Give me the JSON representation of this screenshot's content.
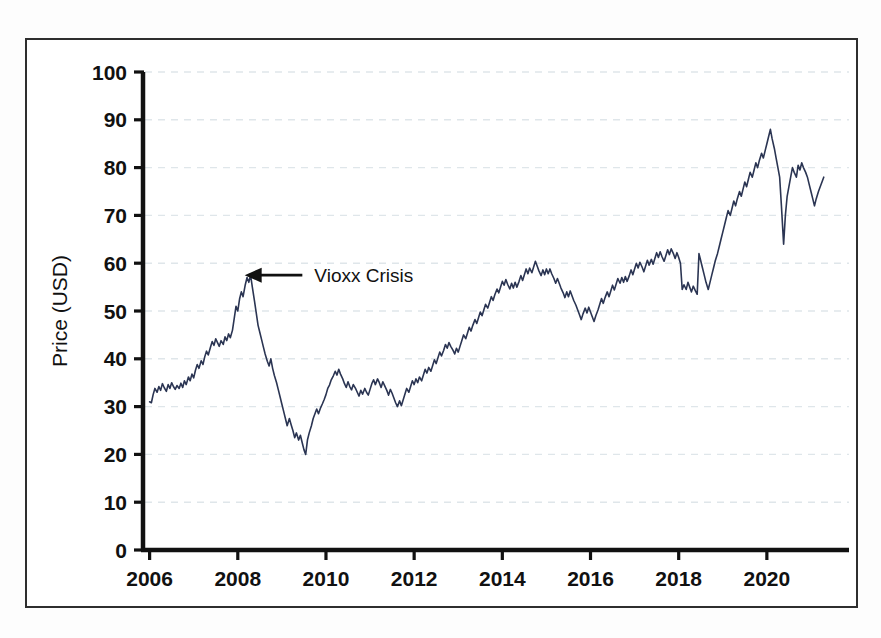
{
  "figure": {
    "background_color": "#ffffff",
    "frame_color": "#2e2e2e",
    "series_color": "#2b3553",
    "grid_color": "#dfe6ea",
    "axis_color": "#111111",
    "annotation_color": "#111111"
  },
  "chart_data": {
    "type": "line",
    "title": "",
    "subtitle": "",
    "xlabel": "",
    "ylabel": "Price (USD)",
    "xlim": [
      2005.85,
      2021.5
    ],
    "ylim": [
      0,
      100
    ],
    "grid": true,
    "grid_axis": "y",
    "grid_style": "dashed",
    "legend": null,
    "legend_position": "none",
    "y_ticks": [
      0,
      10,
      20,
      30,
      40,
      50,
      60,
      70,
      80,
      90,
      100
    ],
    "y_tick_labels": [
      "0",
      "10",
      "20",
      "30",
      "40",
      "50",
      "60",
      "70",
      "80",
      "90",
      "100"
    ],
    "x_ticks": [
      2006,
      2008,
      2010,
      2012,
      2014,
      2016,
      2018,
      2020
    ],
    "x_tick_labels": [
      "2006",
      "2008",
      "2010",
      "2012",
      "2014",
      "2016",
      "2018",
      "2020"
    ],
    "x_minor_step": 2,
    "annotations": [
      {
        "label": "Vioxx Crisis",
        "arrow": true,
        "arrow_direction": "left",
        "point_x": 2008.02,
        "point_y": 57.5,
        "text_x": 2009.6,
        "text_y": 57.5
      }
    ],
    "series": [
      {
        "name": "Price (USD)",
        "color": "#2b3553",
        "line_width": 1.6,
        "x": [
          2006.0,
          2006.04,
          2006.08,
          2006.12,
          2006.17,
          2006.21,
          2006.25,
          2006.29,
          2006.33,
          2006.38,
          2006.42,
          2006.46,
          2006.5,
          2006.54,
          2006.58,
          2006.62,
          2006.67,
          2006.71,
          2006.75,
          2006.79,
          2006.83,
          2006.88,
          2006.92,
          2006.96,
          2007.0,
          2007.04,
          2007.08,
          2007.12,
          2007.17,
          2007.21,
          2007.25,
          2007.29,
          2007.33,
          2007.38,
          2007.42,
          2007.46,
          2007.5,
          2007.54,
          2007.58,
          2007.62,
          2007.67,
          2007.71,
          2007.75,
          2007.79,
          2007.83,
          2007.88,
          2007.92,
          2007.96,
          2008.0,
          2008.04,
          2008.08,
          2008.12,
          2008.17,
          2008.21,
          2008.25,
          2008.29,
          2008.33,
          2008.38,
          2008.42,
          2008.46,
          2008.5,
          2008.54,
          2008.58,
          2008.62,
          2008.67,
          2008.71,
          2008.75,
          2008.79,
          2008.83,
          2008.88,
          2008.92,
          2008.96,
          2009.0,
          2009.04,
          2009.08,
          2009.12,
          2009.17,
          2009.21,
          2009.25,
          2009.29,
          2009.33,
          2009.38,
          2009.42,
          2009.46,
          2009.5,
          2009.54,
          2009.58,
          2009.62,
          2009.67,
          2009.71,
          2009.75,
          2009.79,
          2009.83,
          2009.88,
          2009.92,
          2009.96,
          2010.0,
          2010.04,
          2010.08,
          2010.12,
          2010.17,
          2010.21,
          2010.25,
          2010.29,
          2010.33,
          2010.38,
          2010.42,
          2010.46,
          2010.5,
          2010.54,
          2010.58,
          2010.62,
          2010.67,
          2010.71,
          2010.75,
          2010.79,
          2010.83,
          2010.88,
          2010.92,
          2010.96,
          2011.0,
          2011.04,
          2011.08,
          2011.12,
          2011.17,
          2011.21,
          2011.25,
          2011.29,
          2011.33,
          2011.38,
          2011.42,
          2011.46,
          2011.5,
          2011.54,
          2011.58,
          2011.62,
          2011.67,
          2011.71,
          2011.75,
          2011.79,
          2011.83,
          2011.88,
          2011.92,
          2011.96,
          2012.0,
          2012.04,
          2012.08,
          2012.12,
          2012.17,
          2012.21,
          2012.25,
          2012.29,
          2012.33,
          2012.38,
          2012.42,
          2012.46,
          2012.5,
          2012.54,
          2012.58,
          2012.62,
          2012.67,
          2012.71,
          2012.75,
          2012.79,
          2012.83,
          2012.88,
          2012.92,
          2012.96,
          2013.0,
          2013.04,
          2013.08,
          2013.12,
          2013.17,
          2013.21,
          2013.25,
          2013.29,
          2013.33,
          2013.38,
          2013.42,
          2013.46,
          2013.5,
          2013.54,
          2013.58,
          2013.62,
          2013.67,
          2013.71,
          2013.75,
          2013.79,
          2013.83,
          2013.88,
          2013.92,
          2013.96,
          2014.0,
          2014.04,
          2014.08,
          2014.12,
          2014.17,
          2014.21,
          2014.25,
          2014.29,
          2014.33,
          2014.38,
          2014.42,
          2014.46,
          2014.5,
          2014.54,
          2014.58,
          2014.62,
          2014.67,
          2014.71,
          2014.75,
          2014.79,
          2014.83,
          2014.88,
          2014.92,
          2014.96,
          2015.0,
          2015.04,
          2015.08,
          2015.12,
          2015.17,
          2015.21,
          2015.25,
          2015.29,
          2015.33,
          2015.38,
          2015.42,
          2015.46,
          2015.5,
          2015.54,
          2015.58,
          2015.62,
          2015.67,
          2015.71,
          2015.75,
          2015.79,
          2015.83,
          2015.88,
          2015.92,
          2015.96,
          2016.0,
          2016.04,
          2016.08,
          2016.12,
          2016.17,
          2016.21,
          2016.25,
          2016.29,
          2016.33,
          2016.38,
          2016.42,
          2016.46,
          2016.5,
          2016.54,
          2016.58,
          2016.62,
          2016.67,
          2016.71,
          2016.75,
          2016.79,
          2016.83,
          2016.88,
          2016.92,
          2016.96,
          2017.0,
          2017.04,
          2017.08,
          2017.12,
          2017.17,
          2017.21,
          2017.25,
          2017.29,
          2017.33,
          2017.38,
          2017.42,
          2017.46,
          2017.5,
          2017.54,
          2017.58,
          2017.62,
          2017.67,
          2017.71,
          2017.75,
          2017.79,
          2017.83,
          2017.88,
          2017.92,
          2017.96,
          2018.0,
          2018.04,
          2018.08,
          2018.12,
          2018.17,
          2018.21,
          2018.25,
          2018.29,
          2018.33,
          2018.38,
          2018.42,
          2018.46,
          2018.5,
          2018.54,
          2018.58,
          2018.62,
          2018.67,
          2018.71,
          2018.75,
          2018.79,
          2018.83,
          2018.88,
          2018.92,
          2018.96,
          2019.0,
          2019.04,
          2019.08,
          2019.12,
          2019.17,
          2019.21,
          2019.25,
          2019.29,
          2019.33,
          2019.38,
          2019.42,
          2019.46,
          2019.5,
          2019.54,
          2019.58,
          2019.62,
          2019.67,
          2019.71,
          2019.75,
          2019.79,
          2019.83,
          2019.88,
          2019.92,
          2019.96,
          2020.0,
          2020.04,
          2020.08,
          2020.12,
          2020.17,
          2020.21,
          2020.25,
          2020.29,
          2020.33,
          2020.38,
          2020.42,
          2020.46,
          2020.5,
          2020.54,
          2020.58,
          2020.62,
          2020.67,
          2020.71,
          2020.75,
          2020.79,
          2020.83,
          2020.88,
          2020.92,
          2020.96,
          2021.0,
          2021.04,
          2021.08,
          2021.12,
          2021.17,
          2021.21,
          2021.25,
          2021.29
        ],
        "y": [
          31.0,
          30.8,
          32.5,
          33.8,
          33.0,
          34.2,
          33.4,
          34.8,
          34.0,
          33.2,
          34.6,
          33.8,
          35.0,
          34.2,
          33.6,
          34.4,
          33.8,
          34.9,
          34.0,
          35.4,
          34.6,
          36.2,
          35.4,
          36.8,
          36.0,
          37.6,
          38.8,
          38.0,
          39.6,
          38.8,
          40.4,
          41.6,
          40.8,
          42.4,
          43.6,
          42.8,
          44.2,
          43.4,
          42.6,
          43.8,
          43.0,
          44.6,
          43.8,
          45.2,
          44.4,
          46.0,
          48.5,
          51.0,
          50.0,
          52.5,
          54.0,
          53.0,
          55.5,
          57.0,
          56.0,
          57.5,
          55.0,
          52.0,
          49.5,
          47.0,
          45.5,
          44.0,
          42.5,
          41.0,
          39.5,
          38.5,
          40.0,
          38.0,
          36.5,
          35.0,
          33.5,
          32.0,
          30.5,
          29.0,
          27.5,
          26.0,
          27.5,
          26.2,
          25.0,
          23.5,
          24.5,
          23.0,
          24.0,
          22.5,
          21.0,
          20.0,
          23.0,
          24.5,
          26.0,
          27.5,
          28.5,
          29.5,
          28.5,
          29.8,
          30.6,
          31.5,
          32.5,
          33.8,
          34.5,
          35.6,
          36.5,
          37.4,
          36.6,
          37.8,
          36.8,
          35.8,
          34.8,
          34.0,
          35.2,
          34.2,
          33.5,
          34.6,
          33.8,
          33.0,
          32.2,
          33.4,
          32.6,
          33.8,
          33.0,
          32.4,
          33.6,
          34.8,
          35.6,
          34.6,
          35.8,
          35.0,
          34.0,
          35.2,
          34.4,
          33.4,
          32.4,
          33.6,
          32.8,
          31.8,
          30.8,
          30.0,
          31.2,
          30.2,
          31.4,
          32.6,
          33.8,
          33.0,
          34.2,
          35.4,
          34.6,
          35.8,
          35.0,
          36.2,
          35.4,
          36.6,
          37.8,
          37.0,
          38.2,
          37.4,
          38.6,
          39.8,
          39.0,
          40.2,
          41.4,
          40.6,
          41.8,
          43.0,
          42.2,
          43.4,
          42.6,
          41.8,
          41.0,
          42.2,
          41.4,
          42.6,
          43.8,
          45.0,
          44.2,
          45.4,
          46.6,
          45.8,
          47.0,
          48.2,
          47.4,
          48.6,
          49.8,
          49.0,
          50.2,
          51.4,
          50.6,
          51.8,
          53.0,
          52.2,
          53.4,
          54.6,
          53.8,
          55.0,
          56.2,
          55.4,
          56.6,
          55.6,
          54.6,
          55.8,
          54.8,
          56.0,
          55.0,
          56.2,
          57.4,
          56.4,
          57.6,
          58.8,
          57.8,
          59.0,
          58.0,
          59.2,
          60.4,
          59.4,
          58.4,
          57.4,
          58.6,
          57.6,
          58.8,
          57.8,
          58.8,
          57.8,
          56.8,
          55.8,
          56.8,
          55.8,
          54.8,
          53.8,
          52.8,
          54.0,
          53.0,
          54.2,
          53.2,
          52.2,
          51.2,
          50.2,
          49.2,
          48.2,
          49.4,
          50.6,
          49.6,
          50.8,
          49.8,
          48.8,
          47.8,
          49.0,
          50.2,
          51.4,
          52.6,
          51.6,
          52.8,
          54.0,
          53.0,
          54.2,
          55.4,
          54.4,
          55.6,
          56.8,
          55.8,
          57.0,
          56.0,
          57.2,
          56.2,
          57.4,
          58.6,
          57.6,
          58.8,
          60.0,
          59.0,
          60.2,
          59.2,
          58.2,
          59.4,
          60.6,
          59.6,
          60.8,
          59.8,
          61.0,
          62.2,
          61.2,
          62.4,
          61.4,
          60.4,
          61.6,
          62.8,
          61.8,
          63.0,
          62.0,
          61.0,
          62.2,
          61.2,
          60.0,
          54.5,
          55.5,
          54.5,
          56.0,
          55.0,
          54.0,
          55.2,
          54.2,
          53.5,
          62.0,
          60.5,
          59.0,
          57.5,
          56.0,
          54.5,
          56.0,
          57.5,
          59.0,
          60.5,
          62.0,
          63.5,
          65.0,
          66.5,
          68.0,
          69.5,
          71.0,
          70.0,
          71.5,
          73.0,
          72.0,
          73.5,
          75.0,
          74.0,
          75.5,
          77.0,
          76.0,
          77.5,
          79.0,
          78.0,
          79.5,
          81.0,
          80.0,
          81.5,
          83.0,
          82.0,
          83.5,
          85.0,
          86.5,
          88.0,
          86.0,
          84.0,
          82.0,
          80.0,
          78.0,
          72.0,
          64.0,
          70.0,
          74.0,
          76.0,
          78.0,
          80.0,
          79.0,
          78.0,
          80.5,
          79.5,
          81.0,
          80.0,
          79.0,
          78.0,
          76.5,
          75.0,
          73.5,
          72.0,
          73.5,
          75.0,
          76.0,
          77.0,
          78.0
        ]
      }
    ]
  }
}
